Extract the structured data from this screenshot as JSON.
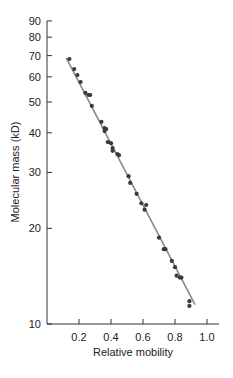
{
  "chart_data": {
    "type": "scatter",
    "title": "",
    "xlabel": "Relative mobility",
    "ylabel": "Molecular mass (kD)",
    "xlim": [
      0,
      1.05
    ],
    "ylim": [
      10,
      90
    ],
    "yscale": "log",
    "grid": false,
    "legend": null,
    "x_ticks": [
      0.2,
      0.4,
      0.6,
      0.8,
      1.0
    ],
    "x_tick_labels": [
      "0.2",
      "0.4",
      "0.6",
      "0.8",
      "1.0"
    ],
    "y_ticks": [
      10,
      20,
      30,
      40,
      50,
      60,
      70,
      80,
      90
    ],
    "y_tick_labels": [
      "10",
      "20",
      "30",
      "40",
      "50",
      "60",
      "70",
      "80",
      "90"
    ],
    "series": [
      {
        "name": "proteins",
        "marker": "circle",
        "color": "#3a3a3a",
        "x": [
          0.14,
          0.17,
          0.19,
          0.21,
          0.24,
          0.26,
          0.27,
          0.28,
          0.34,
          0.36,
          0.36,
          0.37,
          0.38,
          0.4,
          0.41,
          0.41,
          0.44,
          0.45,
          0.51,
          0.52,
          0.56,
          0.59,
          0.62,
          0.61,
          0.7,
          0.73,
          0.74,
          0.78,
          0.8,
          0.81,
          0.83,
          0.84,
          0.89,
          0.89
        ],
        "y": [
          68.3,
          63.5,
          60.8,
          57.8,
          53.4,
          52.6,
          52.6,
          48.6,
          43.3,
          41.4,
          40.5,
          41.1,
          37.4,
          37.1,
          35.8,
          35.1,
          34.3,
          34.0,
          29.2,
          27.8,
          25.7,
          24.0,
          23.7,
          22.9,
          18.7,
          17.2,
          17.2,
          15.8,
          15.1,
          14.2,
          14.0,
          14.0,
          11.8,
          11.4
        ]
      }
    ],
    "fit_line": {
      "name": "linear fit (log scale)",
      "color": "#8a8a8a",
      "x": [
        0.12,
        0.925
      ],
      "y": [
        68.8,
        11.5
      ]
    }
  },
  "layout": {
    "plot_left": 47,
    "plot_bottom": 324,
    "plot_right": 219,
    "x_px_per_unit": 160,
    "y_px_per_decade": 317.6
  }
}
